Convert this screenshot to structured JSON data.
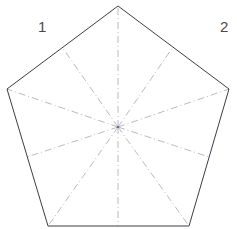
{
  "figure": {
    "canvas": {
      "width": 237,
      "height": 229
    },
    "background_color": "#ffffff",
    "outline": {
      "name": "pentagon-outline",
      "stroke_color": "#3c3c46",
      "stroke_width": 1,
      "style": "solid",
      "vertices": [
        {
          "name": "apex",
          "x": 118,
          "y": 6
        },
        {
          "name": "upper-right",
          "x": 229,
          "y": 89
        },
        {
          "name": "lower-right",
          "x": 189,
          "y": 226
        },
        {
          "name": "lower-left",
          "x": 48,
          "y": 226
        },
        {
          "name": "upper-left",
          "x": 7,
          "y": 89
        }
      ]
    },
    "center": {
      "name": "centroid",
      "x": 118,
      "y": 127
    },
    "construction_lines": {
      "stroke_color": "#b9b9c2",
      "stroke_width": 1,
      "style": "dash-dot",
      "radii": [
        {
          "name": "radius-to-apex",
          "x": 118,
          "y": 6
        },
        {
          "name": "radius-to-upper-right",
          "x": 229,
          "y": 89
        },
        {
          "name": "radius-to-lower-right",
          "x": 189,
          "y": 226
        },
        {
          "name": "radius-to-lower-left",
          "x": 48,
          "y": 226
        },
        {
          "name": "radius-to-upper-left",
          "x": 7,
          "y": 89
        }
      ],
      "apothems": [
        {
          "name": "apothem-upper-left-edge",
          "x": 62,
          "y": 47
        },
        {
          "name": "apothem-upper-right-edge",
          "x": 173,
          "y": 47
        },
        {
          "name": "apothem-right-edge",
          "x": 209,
          "y": 157
        },
        {
          "name": "apothem-bottom-edge",
          "x": 118,
          "y": 226
        },
        {
          "name": "apothem-left-edge",
          "x": 27,
          "y": 157
        }
      ]
    },
    "labels": [
      {
        "name": "label-1",
        "text": "1",
        "x": 38,
        "y": 19
      },
      {
        "name": "label-2",
        "text": "2",
        "x": 220,
        "y": 19
      }
    ]
  }
}
